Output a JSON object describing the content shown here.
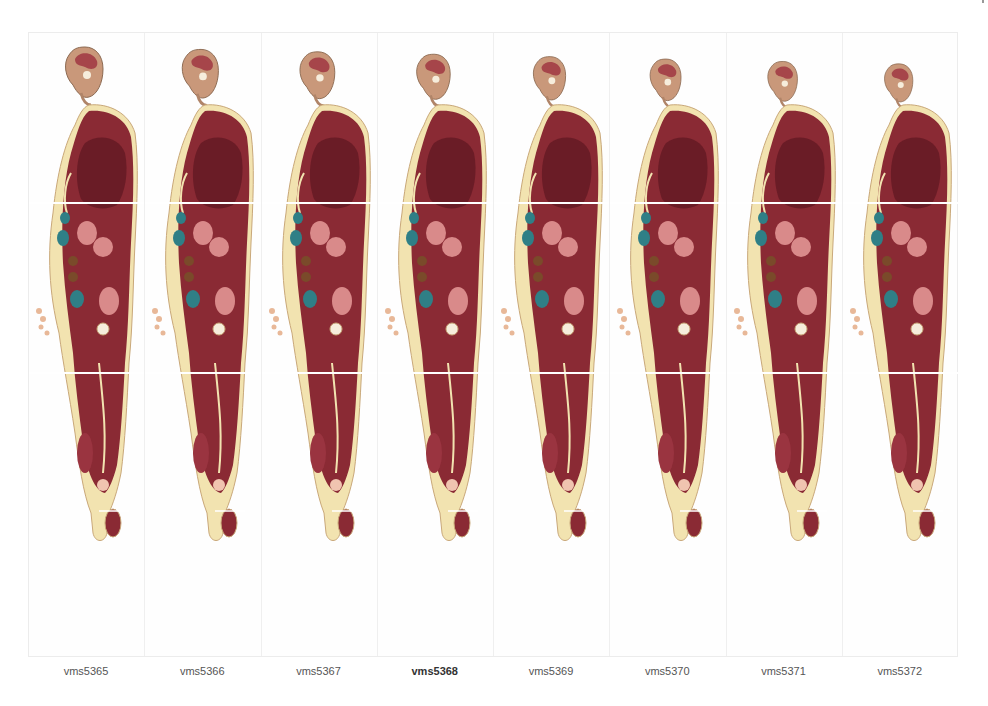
{
  "figure": {
    "panel_count": 8,
    "panels": [
      {
        "id": "vms5365",
        "label": "vms5365",
        "highlighted": false
      },
      {
        "id": "vms5366",
        "label": "vms5366",
        "highlighted": false
      },
      {
        "id": "vms5367",
        "label": "vms5367",
        "highlighted": false
      },
      {
        "id": "vms5368",
        "label": "vms5368",
        "highlighted": true
      },
      {
        "id": "vms5369",
        "label": "vms5369",
        "highlighted": false
      },
      {
        "id": "vms5370",
        "label": "vms5370",
        "highlighted": false
      },
      {
        "id": "vms5371",
        "label": "vms5371",
        "highlighted": false
      },
      {
        "id": "vms5372",
        "label": "vms5372",
        "highlighted": false
      }
    ]
  },
  "colors": {
    "muscle": "#8a2a34",
    "muscle_dark": "#6a1c26",
    "fat": "#f2e3b0",
    "skin_edge": "#c9a87a",
    "organ_teal": "#2f7f86",
    "organ_pink": "#d98a8a",
    "lung_dark": "#5c1520",
    "background": "#ffffff",
    "divider": "#efefef",
    "label_text": "#555555"
  }
}
